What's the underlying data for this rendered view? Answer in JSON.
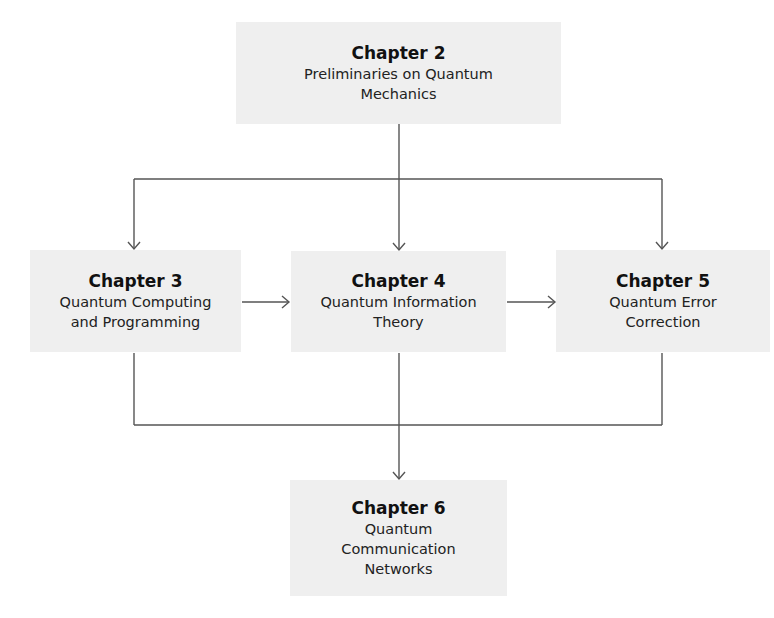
{
  "diagram": {
    "type": "flowchart",
    "nodes": [
      {
        "id": "ch2",
        "title": "Chapter 2",
        "subtitle": "Preliminaries on Quantum\nMechanics"
      },
      {
        "id": "ch3",
        "title": "Chapter 3",
        "subtitle": "Quantum Computing\nand Programming"
      },
      {
        "id": "ch4",
        "title": "Chapter 4",
        "subtitle": "Quantum Information\nTheory"
      },
      {
        "id": "ch5",
        "title": "Chapter 5",
        "subtitle": "Quantum Error\nCorrection"
      },
      {
        "id": "ch6",
        "title": "Chapter 6",
        "subtitle": "Quantum\nCommunication\nNetworks"
      }
    ],
    "edges": [
      {
        "from": "ch2",
        "to": "ch3"
      },
      {
        "from": "ch2",
        "to": "ch4"
      },
      {
        "from": "ch2",
        "to": "ch5"
      },
      {
        "from": "ch3",
        "to": "ch4"
      },
      {
        "from": "ch4",
        "to": "ch5"
      },
      {
        "from": "ch3",
        "to": "ch6"
      },
      {
        "from": "ch4",
        "to": "ch6"
      },
      {
        "from": "ch5",
        "to": "ch6"
      }
    ],
    "colors": {
      "box_fill": "#efefef",
      "line": "#555555",
      "text": "#1c1c1c"
    }
  }
}
